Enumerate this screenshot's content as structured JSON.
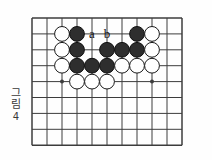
{
  "figure": {
    "caption_chars": [
      "그",
      "림"
    ],
    "caption_number": "4",
    "caption_full": "그림 4"
  },
  "board": {
    "columns": 11,
    "rows": 9,
    "origin_x": 32,
    "origin_y": 18,
    "step_x": 15.0,
    "step_y": 15.9,
    "line_color": "#3c3c3c",
    "border_color": "#2a2a2a",
    "background_color": "#fefefe",
    "stone_radius": 7.4,
    "star_points": [
      {
        "col": 2,
        "row": 4
      },
      {
        "col": 8,
        "row": 4
      }
    ]
  },
  "stones": [
    {
      "col": 2,
      "row": 1,
      "color": "white"
    },
    {
      "col": 3,
      "row": 1,
      "color": "black"
    },
    {
      "col": 7,
      "row": 1,
      "color": "black"
    },
    {
      "col": 8,
      "row": 1,
      "color": "white"
    },
    {
      "col": 2,
      "row": 2,
      "color": "white"
    },
    {
      "col": 3,
      "row": 2,
      "color": "black"
    },
    {
      "col": 5,
      "row": 2,
      "color": "black"
    },
    {
      "col": 6,
      "row": 2,
      "color": "black"
    },
    {
      "col": 7,
      "row": 2,
      "color": "black"
    },
    {
      "col": 8,
      "row": 2,
      "color": "white"
    },
    {
      "col": 2,
      "row": 3,
      "color": "white"
    },
    {
      "col": 3,
      "row": 3,
      "color": "black"
    },
    {
      "col": 4,
      "row": 3,
      "color": "black"
    },
    {
      "col": 5,
      "row": 3,
      "color": "black"
    },
    {
      "col": 6,
      "row": 3,
      "color": "white"
    },
    {
      "col": 7,
      "row": 3,
      "color": "white"
    },
    {
      "col": 8,
      "row": 3,
      "color": "white"
    },
    {
      "col": 3,
      "row": 4,
      "color": "white"
    },
    {
      "col": 4,
      "row": 4,
      "color": "white"
    },
    {
      "col": 5,
      "row": 4,
      "color": "white"
    }
  ],
  "point_labels": [
    {
      "text": "a",
      "col": 4,
      "row": 1
    },
    {
      "text": "b",
      "col": 5,
      "row": 1
    }
  ],
  "colors": {
    "black_stone_fill": "#2e2e2e",
    "black_stone_stroke": "#111111",
    "white_stone_fill": "#ffffff",
    "white_stone_stroke": "#1a1a1a",
    "grid_line": "#3c3c3c",
    "text": "#111111"
  }
}
